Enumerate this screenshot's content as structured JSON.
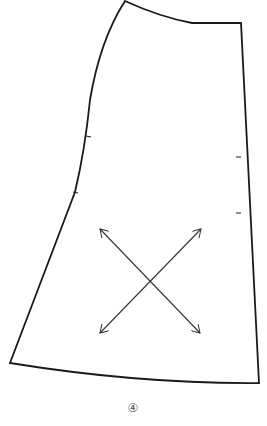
{
  "diagram": {
    "type": "sewing-pattern-piece",
    "piece_label": "④",
    "colors": {
      "outline": "#1a1a1a",
      "arrow": "#333333",
      "label": "#555555"
    },
    "elements": [
      {
        "name": "pattern-outline"
      },
      {
        "name": "notch-left-upper"
      },
      {
        "name": "notch-left-lower"
      },
      {
        "name": "notch-right-upper"
      },
      {
        "name": "notch-right-lower"
      },
      {
        "name": "grainline-arrow-diagonal-1"
      },
      {
        "name": "grainline-arrow-diagonal-2"
      }
    ]
  }
}
